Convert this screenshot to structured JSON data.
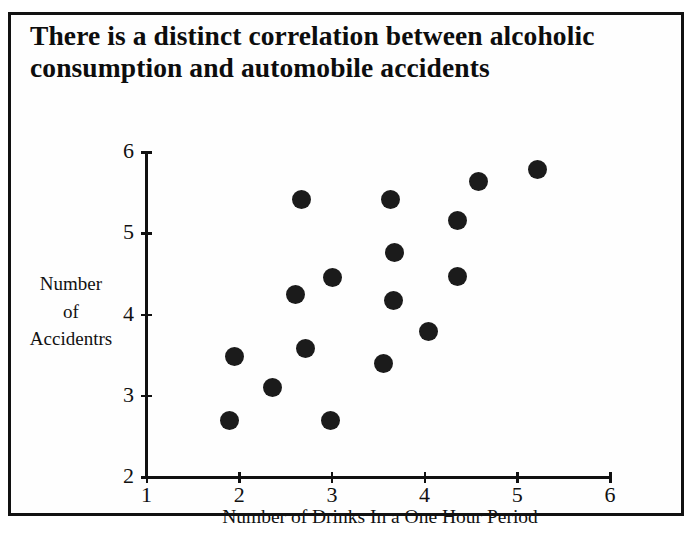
{
  "figure": {
    "title": "There is a distinct correlation between alcoholic consumption and automobile accidents",
    "border_color": "#111111",
    "point_color": "#1b1b1b",
    "background_color": "#fefefe"
  },
  "chart_data": {
    "type": "scatter",
    "title": "There is a distinct correlation between alcoholic consumption and automobile accidents",
    "xlabel": "Number of Drinks In a One Hour Period",
    "ylabel": "Number of Accidentrs",
    "ylabel_lines": [
      "Number",
      "of",
      "Accidentrs"
    ],
    "xlim": [
      1,
      6
    ],
    "ylim": [
      2,
      6
    ],
    "xticks": [
      1,
      2,
      3,
      4,
      5,
      6
    ],
    "yticks": [
      2,
      3,
      4,
      5,
      6
    ],
    "xtick_labels": [
      "1",
      "2",
      "3",
      "4",
      "5",
      "6"
    ],
    "ytick_labels": [
      "2",
      "3",
      "4",
      "5",
      "6"
    ],
    "grid": false,
    "legend": false,
    "n_points": 17,
    "points": [
      {
        "x": 1.89,
        "y": 2.69
      },
      {
        "x": 1.95,
        "y": 3.48
      },
      {
        "x": 2.36,
        "y": 3.1
      },
      {
        "x": 2.61,
        "y": 4.25
      },
      {
        "x": 2.67,
        "y": 5.42
      },
      {
        "x": 2.72,
        "y": 3.58
      },
      {
        "x": 2.99,
        "y": 2.69
      },
      {
        "x": 3.01,
        "y": 4.45
      },
      {
        "x": 3.56,
        "y": 3.4
      },
      {
        "x": 3.63,
        "y": 5.42
      },
      {
        "x": 3.66,
        "y": 4.17
      },
      {
        "x": 3.67,
        "y": 4.76
      },
      {
        "x": 4.04,
        "y": 3.79
      },
      {
        "x": 4.35,
        "y": 5.16
      },
      {
        "x": 4.35,
        "y": 4.47
      },
      {
        "x": 4.58,
        "y": 5.64
      },
      {
        "x": 5.22,
        "y": 5.79
      }
    ]
  }
}
